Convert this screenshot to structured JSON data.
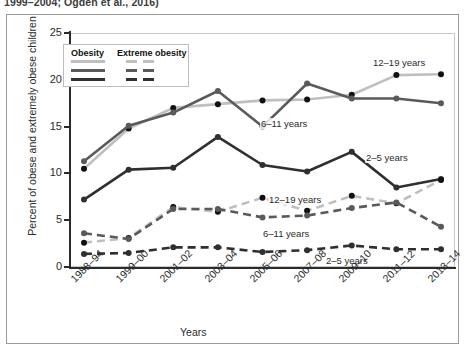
{
  "caption": "1999–2004; Ogden et al., 2016)",
  "legend": {
    "col1_header": "Obesity",
    "col2_header": "Extreme obesity",
    "rows": [
      {
        "name": "12-19 years",
        "color": "#bfbfbf"
      },
      {
        "name": "6-11 years",
        "color": "#5a5a5a"
      },
      {
        "name": "2-5 years",
        "color": "#2f2f2f"
      }
    ]
  },
  "axes": {
    "ylabel": "Percent of obese and extremely obese children",
    "xlabel": "Years",
    "yticks": [
      "0",
      "5",
      "10",
      "15",
      "20",
      "25"
    ],
    "ymin": 0,
    "ymax": 25
  },
  "plot_labels": {
    "obesity_12_19": "12–19 years",
    "obesity_6_11": "6–11 years",
    "obesity_2_5": "2–5 years",
    "extreme_12_19": "12–19 years",
    "extreme_6_11": "6–11 years",
    "extreme_2_5": "2–5 years"
  },
  "colors": {
    "dark": "#2f2f2f",
    "medium": "#5a5a5a",
    "light": "#bfbfbf",
    "axis": "#2b2b2b",
    "grid": "#d8d8d8",
    "frame": "#9a9a9a"
  },
  "chart_data": {
    "type": "line",
    "title": "",
    "xlabel": "Years",
    "ylabel": "Percent of obese and extremely obese children",
    "ylim": [
      0,
      25
    ],
    "grid": true,
    "legend_position": "upper-left-inside",
    "categories": [
      "1988–94",
      "1999–00",
      "2001–02",
      "2003–04",
      "2005–06",
      "2007–08",
      "2009–10",
      "2011–12",
      "2013–14"
    ],
    "series": [
      {
        "name": "Obesity 6–11 years",
        "style": "solid",
        "color": "#5a5a5a",
        "values": [
          11.3,
          15.1,
          16.5,
          18.8,
          15.0,
          19.6,
          18.0,
          18.0,
          17.5
        ]
      },
      {
        "name": "Obesity 12–19 years",
        "style": "solid",
        "color": "#bfbfbf",
        "values": [
          10.5,
          14.8,
          17.0,
          17.4,
          17.8,
          17.9,
          18.4,
          20.5,
          20.6
        ]
      },
      {
        "name": "Obesity 2–5 years",
        "style": "solid",
        "color": "#2f2f2f",
        "values": [
          7.2,
          10.4,
          10.6,
          13.9,
          10.9,
          10.2,
          12.3,
          8.5,
          9.4
        ]
      },
      {
        "name": "Extreme obesity 12–19 years",
        "style": "dashed",
        "color": "#bfbfbf",
        "values": [
          2.6,
          3.1,
          6.4,
          5.9,
          7.4,
          6.0,
          7.6,
          6.8,
          9.3
        ]
      },
      {
        "name": "Extreme obesity 6–11 years",
        "style": "dashed",
        "color": "#5a5a5a",
        "values": [
          3.6,
          3.0,
          6.2,
          6.2,
          5.3,
          5.5,
          6.3,
          6.9,
          4.3
        ]
      },
      {
        "name": "Extreme obesity 2–5 years",
        "style": "dashed",
        "color": "#2f2f2f",
        "values": [
          1.4,
          1.5,
          2.1,
          2.1,
          1.6,
          1.8,
          2.3,
          1.9,
          1.9
        ]
      }
    ]
  }
}
